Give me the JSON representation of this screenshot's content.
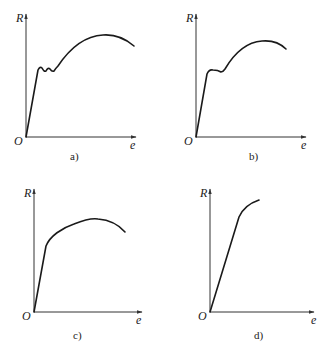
{
  "figure": {
    "panels": [
      {
        "id": "a",
        "caption": "a)",
        "y_label": "R",
        "x_label": "e",
        "origin_label": "O",
        "shape": "elastic then serrated yield plateau then strain hardening to peak then necking"
      },
      {
        "id": "b",
        "caption": "b)",
        "y_label": "R",
        "x_label": "e",
        "origin_label": "O",
        "shape": "elastic then single yield drop plateau then hardening to peak then necking"
      },
      {
        "id": "c",
        "caption": "c)",
        "y_label": "R",
        "x_label": "e",
        "origin_label": "O",
        "shape": "elastic then continuous yielding to peak then necking"
      },
      {
        "id": "d",
        "caption": "d)",
        "y_label": "R",
        "x_label": "e",
        "origin_label": "O",
        "shape": "elastic then short hardening, brittle fracture"
      }
    ]
  },
  "colors": {
    "line": "#1a1a1a",
    "axis": "#333333",
    "background": "#ffffff"
  }
}
